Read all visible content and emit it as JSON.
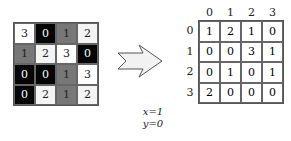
{
  "input_grid": {
    "values": [
      [
        3,
        0,
        1,
        2
      ],
      [
        1,
        2,
        3,
        0
      ],
      [
        0,
        0,
        1,
        3
      ],
      [
        0,
        2,
        1,
        2
      ]
    ],
    "shades": {
      "0": "#050505",
      "1": "#777777",
      "2": "#f4f4f4",
      "3": "#ffffff"
    },
    "text_colors": {
      "0": "#ffffff",
      "1": "#222222",
      "2": "#222222",
      "3": "#222222"
    }
  },
  "arrow": {
    "fill": "#f2f2f2",
    "stroke": "#555555"
  },
  "output_matrix": {
    "col_headers": [
      "0",
      "1",
      "2",
      "3"
    ],
    "row_headers": [
      "0",
      "1",
      "2",
      "3"
    ],
    "values": [
      [
        1,
        2,
        1,
        0
      ],
      [
        0,
        0,
        3,
        1
      ],
      [
        0,
        1,
        0,
        1
      ],
      [
        2,
        0,
        0,
        0
      ]
    ]
  },
  "offset": {
    "x_label": "x=1",
    "y_label": "y=0"
  }
}
